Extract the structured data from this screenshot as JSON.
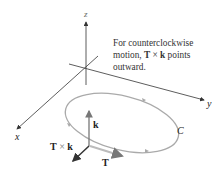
{
  "diagram": {
    "axes": {
      "x_label": "x",
      "y_label": "y",
      "z_label": "z"
    },
    "annotation": {
      "line1": "For counterclockwise",
      "line2_prefix": "motion, ",
      "line2_T": "T",
      "line2_times": " × ",
      "line2_k": "k",
      "line2_suffix": " points",
      "line3": "outward."
    },
    "vectors": {
      "k_label": "k",
      "TxK_T": "T",
      "TxK_times": " × ",
      "TxK_k": "k",
      "T_label": "T"
    },
    "curve_label": "C",
    "colors": {
      "axis": "#333333",
      "curve": "#a8a8a8",
      "vector": "#555555",
      "dark_vector": "#333333"
    }
  }
}
